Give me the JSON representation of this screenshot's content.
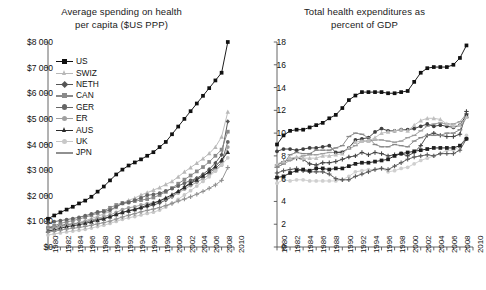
{
  "figure": {
    "background": "#ffffff",
    "panels": 2
  },
  "left_panel": {
    "title_line1": "Average spending on health",
    "title_line2": "per capita ($US PPP)"
  },
  "right_panel": {
    "title_line1": "Total health expenditures as",
    "title_line2": "percent of GDP"
  },
  "chart_data": [
    {
      "type": "line",
      "title": "Average spending on health per capita ($US PPP)",
      "xlabel": "",
      "ylabel": "",
      "xlim": [
        1980,
        2010
      ],
      "ylim": [
        0,
        8000
      ],
      "ytick_labels": [
        "$0",
        "$1 000",
        "$2 000",
        "$3 000",
        "$4 000",
        "$5 000",
        "$6 000",
        "$7 000",
        "$8 000"
      ],
      "ytick_values": [
        0,
        1000,
        2000,
        3000,
        4000,
        5000,
        6000,
        7000,
        8000
      ],
      "xtick_labels": [
        "1980",
        "1982",
        "1984",
        "1986",
        "1988",
        "1990",
        "1992",
        "1994",
        "1996",
        "1998",
        "2000",
        "2002",
        "2004",
        "2006",
        "2008",
        "2010"
      ],
      "xtick_values": [
        1980,
        1982,
        1984,
        1986,
        1988,
        1990,
        1992,
        1994,
        1996,
        1998,
        2000,
        2002,
        2004,
        2006,
        2008,
        2010
      ],
      "grid": false,
      "legend_position": "upper-left-inside",
      "x": [
        1980,
        1981,
        1982,
        1983,
        1984,
        1985,
        1986,
        1987,
        1988,
        1989,
        1990,
        1991,
        1992,
        1993,
        1994,
        1995,
        1996,
        1997,
        1998,
        1999,
        2000,
        2001,
        2002,
        2003,
        2004,
        2005,
        2006,
        2007,
        2008,
        2009
      ],
      "series": [
        {
          "name": "US",
          "color": "#111111",
          "marker": "square",
          "values": [
            1102,
            1230,
            1350,
            1460,
            1570,
            1700,
            1810,
            1960,
            2160,
            2360,
            2600,
            2830,
            3020,
            3180,
            3300,
            3420,
            3560,
            3700,
            3900,
            4100,
            4400,
            4700,
            5000,
            5300,
            5600,
            5900,
            6200,
            6500,
            6800,
            8000
          ]
        },
        {
          "name": "SWIZ",
          "color": "#b8b8b8",
          "marker": "triangle",
          "values": [
            670,
            730,
            790,
            850,
            900,
            960,
            1030,
            1110,
            1200,
            1290,
            1400,
            1550,
            1700,
            1820,
            1910,
            2030,
            2120,
            2220,
            2320,
            2440,
            2560,
            2740,
            2930,
            3100,
            3270,
            3450,
            3650,
            3900,
            4300,
            5270
          ]
        },
        {
          "name": "NETH",
          "color": "#555555",
          "marker": "diamond",
          "values": [
            740,
            790,
            840,
            880,
            900,
            930,
            980,
            1030,
            1080,
            1120,
            1180,
            1270,
            1350,
            1420,
            1460,
            1520,
            1580,
            1640,
            1720,
            1830,
            1960,
            2140,
            2340,
            2520,
            2680,
            2840,
            3030,
            3280,
            3600,
            4900
          ]
        },
        {
          "name": "CAN",
          "color": "#8a8a8a",
          "marker": "square",
          "values": [
            760,
            830,
            920,
            980,
            1030,
            1090,
            1160,
            1240,
            1320,
            1410,
            1530,
            1640,
            1720,
            1760,
            1790,
            1830,
            1870,
            1930,
            2030,
            2150,
            2300,
            2470,
            2630,
            2790,
            2950,
            3120,
            3320,
            3560,
            3800,
            4500
          ]
        },
        {
          "name": "GER",
          "color": "#666666",
          "marker": "circle",
          "values": [
            940,
            990,
            1030,
            1070,
            1110,
            1160,
            1220,
            1290,
            1370,
            1380,
            1440,
            1570,
            1700,
            1730,
            1830,
            1920,
            2020,
            2050,
            2100,
            2190,
            2280,
            2380,
            2490,
            2600,
            2680,
            2790,
            2910,
            3060,
            3300,
            4100
          ]
        },
        {
          "name": "ER",
          "color": "#a0a0a0",
          "marker": "circle",
          "values": [
            690,
            740,
            800,
            850,
            890,
            930,
            990,
            1050,
            1120,
            1180,
            1250,
            1350,
            1460,
            1530,
            1570,
            1640,
            1690,
            1730,
            1790,
            1880,
            1980,
            2110,
            2260,
            2400,
            2530,
            2670,
            2820,
            3000,
            3200,
            3900
          ]
        },
        {
          "name": "AUS",
          "color": "#2b2b2b",
          "marker": "triangle",
          "values": [
            620,
            670,
            730,
            790,
            830,
            870,
            920,
            980,
            1040,
            1100,
            1180,
            1270,
            1350,
            1410,
            1470,
            1550,
            1630,
            1710,
            1800,
            1920,
            2040,
            2180,
            2330,
            2480,
            2620,
            2770,
            2940,
            3150,
            3400,
            3700
          ]
        },
        {
          "name": "UK",
          "color": "#c8c8c8",
          "marker": "circle",
          "values": [
            470,
            510,
            550,
            590,
            620,
            650,
            690,
            740,
            800,
            850,
            920,
            1000,
            1080,
            1140,
            1190,
            1250,
            1310,
            1360,
            1440,
            1560,
            1700,
            1860,
            2030,
            2200,
            2380,
            2560,
            2740,
            2960,
            3200,
            3480
          ]
        },
        {
          "name": "JPN",
          "color": "#909090",
          "marker": "plus",
          "values": [
            580,
            620,
            660,
            700,
            730,
            760,
            800,
            850,
            900,
            950,
            1010,
            1090,
            1170,
            1240,
            1300,
            1370,
            1430,
            1480,
            1540,
            1620,
            1700,
            1790,
            1870,
            1960,
            2060,
            2170,
            2290,
            2420,
            2600,
            3100
          ]
        }
      ]
    },
    {
      "type": "line",
      "title": "Total health expenditures as percent of GDP",
      "xlabel": "",
      "ylabel": "",
      "xlim": [
        1980,
        2010
      ],
      "ylim": [
        0,
        18
      ],
      "ytick_labels": [
        "0",
        "2",
        "4",
        "6",
        "8",
        "10",
        "12",
        "14",
        "16",
        "18"
      ],
      "ytick_values": [
        0,
        2,
        4,
        6,
        8,
        10,
        12,
        14,
        16,
        18
      ],
      "xtick_labels": [
        "1980",
        "1982",
        "1984",
        "1986",
        "1988",
        "1990",
        "1992",
        "1994",
        "1996",
        "1998",
        "2000",
        "2002",
        "2004",
        "2006",
        "2008",
        "2010"
      ],
      "xtick_values": [
        1980,
        1982,
        1984,
        1986,
        1988,
        1990,
        1992,
        1994,
        1996,
        1998,
        2000,
        2002,
        2004,
        2006,
        2008,
        2010
      ],
      "grid": false,
      "legend_position": "lower-right-inside",
      "x": [
        1980,
        1981,
        1982,
        1983,
        1984,
        1985,
        1986,
        1987,
        1988,
        1989,
        1990,
        1991,
        1992,
        1993,
        1994,
        1995,
        1996,
        1997,
        1998,
        1999,
        2000,
        2001,
        2002,
        2003,
        2004,
        2005,
        2006,
        2007,
        2008,
        2009
      ],
      "series": [
        {
          "name": "US",
          "color": "#111111",
          "marker": "square",
          "values": [
            9.0,
            9.8,
            10.2,
            10.3,
            10.3,
            10.5,
            10.7,
            10.9,
            11.3,
            11.6,
            12.2,
            12.9,
            13.3,
            13.6,
            13.6,
            13.6,
            13.6,
            13.5,
            13.5,
            13.6,
            13.7,
            14.5,
            15.3,
            15.7,
            15.8,
            15.8,
            15.8,
            16.0,
            16.6,
            17.7
          ]
        },
        {
          "name": "NETH",
          "color": "#444444",
          "marker": "plus",
          "values": [
            7.2,
            7.5,
            7.7,
            7.8,
            7.7,
            7.3,
            7.2,
            7.4,
            7.4,
            7.5,
            7.7,
            7.9,
            8.0,
            8.3,
            8.1,
            8.3,
            8.2,
            8.0,
            8.1,
            8.2,
            8.0,
            8.3,
            8.9,
            9.8,
            10.0,
            9.8,
            9.7,
            9.7,
            9.9,
            11.9
          ]
        },
        {
          "name": "FR",
          "color": "#9d9d9d",
          "marker": "dash",
          "values": [
            7.0,
            7.3,
            7.6,
            7.8,
            8.0,
            8.1,
            8.1,
            8.2,
            8.3,
            8.3,
            8.4,
            8.6,
            8.9,
            9.3,
            9.3,
            9.4,
            9.4,
            9.3,
            9.2,
            9.3,
            9.6,
            9.8,
            10.2,
            10.6,
            10.8,
            10.9,
            10.8,
            10.8,
            11.0,
            11.7
          ]
        },
        {
          "name": "GER",
          "color": "#3f3f3f",
          "marker": "circle",
          "values": [
            8.4,
            8.6,
            8.6,
            8.5,
            8.6,
            8.7,
            8.7,
            8.8,
            8.9,
            8.3,
            8.3,
            8.7,
            9.4,
            9.5,
            9.6,
            10.1,
            10.4,
            10.2,
            10.2,
            10.3,
            10.3,
            10.4,
            10.6,
            10.8,
            10.6,
            10.7,
            10.6,
            10.5,
            10.7,
            11.6
          ]
        },
        {
          "name": "CAN",
          "color": "#888888",
          "marker": "dash",
          "values": [
            7.0,
            7.3,
            8.1,
            8.3,
            8.2,
            8.2,
            8.5,
            8.5,
            8.5,
            8.7,
            8.9,
            9.7,
            10.0,
            9.9,
            9.6,
            9.0,
            8.8,
            8.8,
            9.0,
            8.9,
            8.8,
            9.3,
            9.6,
            9.8,
            9.8,
            9.8,
            10.0,
            10.0,
            10.3,
            11.4
          ]
        },
        {
          "name": "SWIZ",
          "color": "#bfbfbf",
          "marker": "triangle",
          "values": [
            7.3,
            7.5,
            7.8,
            7.9,
            7.8,
            7.8,
            7.8,
            8.0,
            8.0,
            8.1,
            8.2,
            8.7,
            9.2,
            9.3,
            9.3,
            9.6,
            10.0,
            10.1,
            10.2,
            10.3,
            10.2,
            10.7,
            11.1,
            11.3,
            11.3,
            11.2,
            10.8,
            10.6,
            10.7,
            11.4
          ]
        },
        {
          "name": "UK",
          "color": "#cfcfcf",
          "marker": "circle",
          "values": [
            5.6,
            5.9,
            5.8,
            5.9,
            5.9,
            5.8,
            5.8,
            5.8,
            5.8,
            5.8,
            5.9,
            6.2,
            6.6,
            6.7,
            6.8,
            6.8,
            6.9,
            6.6,
            6.7,
            6.9,
            7.0,
            7.3,
            7.6,
            7.8,
            8.0,
            8.2,
            8.5,
            8.5,
            8.8,
            9.8
          ]
        },
        {
          "name": "JPN",
          "color": "#5a5a5a",
          "marker": "plus",
          "values": [
            6.5,
            6.7,
            6.8,
            6.9,
            6.7,
            6.6,
            6.6,
            6.6,
            6.4,
            6.0,
            5.9,
            5.9,
            6.2,
            6.4,
            6.6,
            6.8,
            6.9,
            6.8,
            7.1,
            7.4,
            7.7,
            7.9,
            8.0,
            8.1,
            8.0,
            8.2,
            8.2,
            8.2,
            8.5,
            9.5
          ]
        },
        {
          "name": "AUS",
          "color": "#1f1f1f",
          "marker": "square",
          "values": [
            6.1,
            6.2,
            6.5,
            6.7,
            6.8,
            6.7,
            6.9,
            6.9,
            6.8,
            6.9,
            6.9,
            7.1,
            7.3,
            7.4,
            7.4,
            7.5,
            7.6,
            7.7,
            8.0,
            8.2,
            8.3,
            8.4,
            8.5,
            8.6,
            8.7,
            8.7,
            8.7,
            8.7,
            8.9,
            9.5
          ]
        }
      ]
    }
  ],
  "left_legend": {
    "items": [
      {
        "label": "US"
      },
      {
        "label": "SWIZ"
      },
      {
        "label": "NETH"
      },
      {
        "label": "CAN"
      },
      {
        "label": "GER"
      },
      {
        "label": "ER"
      },
      {
        "label": "AUS"
      },
      {
        "label": "UK"
      },
      {
        "label": "JPN"
      }
    ]
  },
  "right_legend": {
    "items": [
      {
        "label": "US"
      },
      {
        "label": "NETH"
      },
      {
        "label": "FR"
      },
      {
        "label": "GER"
      },
      {
        "label": "CAN"
      },
      {
        "label": "SWIZ"
      },
      {
        "label": "UK"
      },
      {
        "label": "JPN"
      },
      {
        "label": "AUS"
      }
    ]
  }
}
